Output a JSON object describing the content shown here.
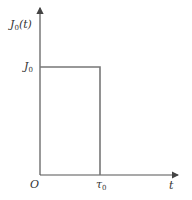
{
  "diagram": {
    "type": "rectangular pulse waveform",
    "y_axis_label": {
      "main": "J",
      "sub": "0",
      "suffix": "(t)"
    },
    "x_axis_label": "t",
    "origin_label": "O",
    "level_label": {
      "main": "J",
      "sub": "0"
    },
    "pulse_end_label": {
      "main": "τ",
      "sub": "0"
    },
    "colors": {
      "axis": "#555555",
      "pulse": "#777777",
      "text": "#333333"
    }
  }
}
